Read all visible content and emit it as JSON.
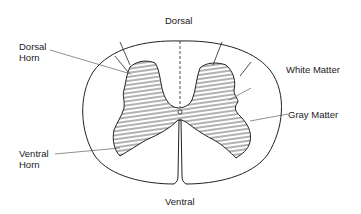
{
  "diagram": {
    "labels": {
      "dorsal": "Dorsal",
      "ventral": "Ventral",
      "dorsal_horn_line1": "Dorsal",
      "dorsal_horn_line2": "Horn",
      "ventral_horn_line1": "Ventral",
      "ventral_horn_line2": "Horn",
      "white_matter": "White Matter",
      "gray_matter": "Gray Matter"
    },
    "colors": {
      "stroke": "#222222",
      "background": "#ffffff",
      "text": "#1a1a1a"
    }
  }
}
